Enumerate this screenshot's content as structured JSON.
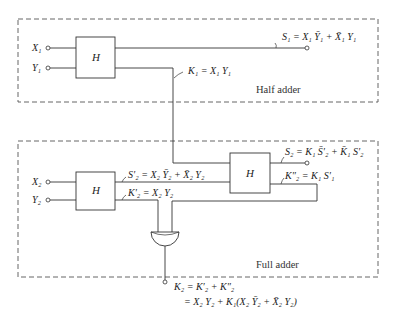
{
  "diagram": {
    "type": "logic-circuit",
    "colors": {
      "line": "#333333",
      "dash": "#555555",
      "background": "#ffffff"
    },
    "half_adder": {
      "caption": "Half adder",
      "block_label": "H",
      "inputs": {
        "x": "X₁",
        "y": "Y₁"
      },
      "outputs": {
        "sum": "S₁ = X₁ Ȳ₁ + X̄₁ Y₁",
        "carry": "K₁ = X₁ Y₁"
      }
    },
    "full_adder": {
      "caption": "Full adder",
      "block_left_label": "H",
      "block_right_label": "H",
      "inputs": {
        "x": "X₂",
        "y": "Y₂"
      },
      "intermediate": {
        "sum_prime": "S′₂ = X₂ Ȳ₂ + X̄₂ Y₂",
        "carry_prime": "K′₂ = X₂ Y₂",
        "carry_double_prime": "K″₂ = K₁ S′₁"
      },
      "outputs": {
        "sum": "S₂ = K₁ S̄′₂ + K̄₁ S′₂",
        "carry_line1": "K₂ = K′₂ + K″₂",
        "carry_line2": "= X₂ Y₂ + K₁(X₂ Ȳ₂ + X̄₂ Y₂)"
      },
      "gate": "OR"
    }
  }
}
